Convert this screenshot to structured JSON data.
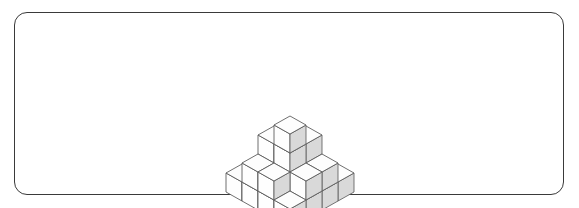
{
  "image": {
    "kind": "isometric-cube-stack-illustration",
    "background_color": "#ffffff"
  },
  "frame": {
    "name": "rounded-rectangle-border",
    "x": 14,
    "y": 12,
    "width": 550,
    "height": 183,
    "corner_radius": 13,
    "stroke_color": "#3a3a3a",
    "stroke_width": 1.1,
    "fill": "none"
  },
  "cube_style": {
    "top_face_color": "#fdfdfd",
    "left_face_color": "#fefefe",
    "right_face_color": "#d9d9d9",
    "edge_color": "#565656",
    "edge_width": 0.85
  },
  "projection": {
    "type": "isometric",
    "half_width": 16,
    "half_height": 9,
    "cube_height": 19,
    "origin_x": 290,
    "origin_y": 146
  },
  "chart_data": {
    "type": "table",
    "xlabel": "grid column (x)",
    "ylabel": "grid row (y)",
    "categories": [
      "x0",
      "x1",
      "x2",
      "x3"
    ],
    "series": [
      {
        "name": "y0",
        "values": [
          1,
          1,
          1,
          1
        ]
      },
      {
        "name": "y1",
        "values": [
          1,
          2,
          3,
          2
        ]
      },
      {
        "name": "y2",
        "values": [
          1,
          3,
          4,
          2
        ]
      },
      {
        "name": "y3",
        "values": [
          1,
          2,
          2,
          1
        ]
      }
    ],
    "total_cubes": 28,
    "max_height": 4,
    "footprint": "4 x 4",
    "cubes": [
      {
        "x": 0,
        "y": 0,
        "z": 0
      },
      {
        "x": 1,
        "y": 0,
        "z": 0
      },
      {
        "x": 2,
        "y": 0,
        "z": 0
      },
      {
        "x": 3,
        "y": 0,
        "z": 0
      },
      {
        "x": 0,
        "y": 1,
        "z": 0
      },
      {
        "x": 1,
        "y": 1,
        "z": 0
      },
      {
        "x": 1,
        "y": 1,
        "z": 1
      },
      {
        "x": 2,
        "y": 1,
        "z": 0
      },
      {
        "x": 2,
        "y": 1,
        "z": 1
      },
      {
        "x": 2,
        "y": 1,
        "z": 2
      },
      {
        "x": 3,
        "y": 1,
        "z": 0
      },
      {
        "x": 3,
        "y": 1,
        "z": 1
      },
      {
        "x": 0,
        "y": 2,
        "z": 0
      },
      {
        "x": 1,
        "y": 2,
        "z": 0
      },
      {
        "x": 1,
        "y": 2,
        "z": 1
      },
      {
        "x": 1,
        "y": 2,
        "z": 2
      },
      {
        "x": 2,
        "y": 2,
        "z": 0
      },
      {
        "x": 2,
        "y": 2,
        "z": 1
      },
      {
        "x": 2,
        "y": 2,
        "z": 2
      },
      {
        "x": 2,
        "y": 2,
        "z": 3
      },
      {
        "x": 3,
        "y": 2,
        "z": 0
      },
      {
        "x": 3,
        "y": 2,
        "z": 1
      },
      {
        "x": 0,
        "y": 3,
        "z": 0
      },
      {
        "x": 1,
        "y": 3,
        "z": 0
      },
      {
        "x": 1,
        "y": 3,
        "z": 1
      },
      {
        "x": 2,
        "y": 3,
        "z": 0
      },
      {
        "x": 2,
        "y": 3,
        "z": 1
      },
      {
        "x": 3,
        "y": 3,
        "z": 0
      }
    ]
  }
}
